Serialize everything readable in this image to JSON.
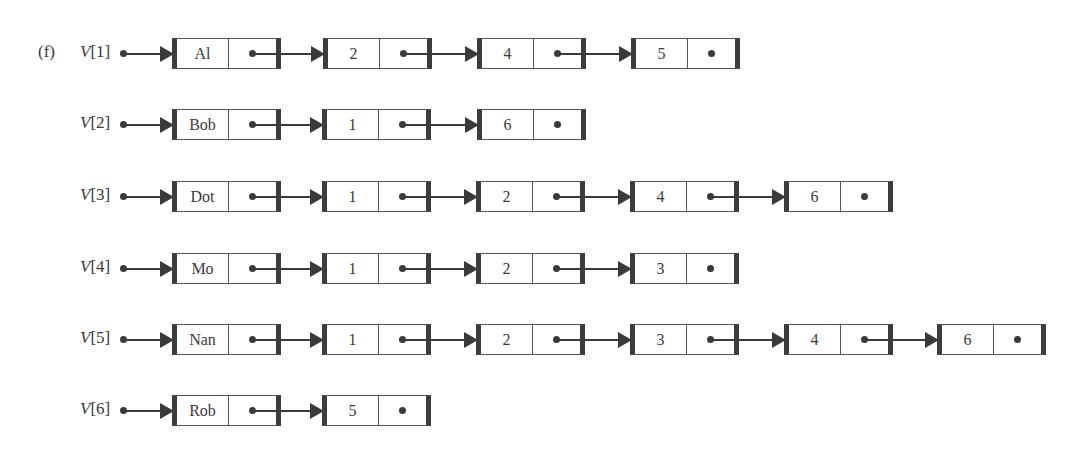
{
  "figure_label": "(f)",
  "lists": [
    {
      "head": "V[1]",
      "nodes": [
        "Al",
        "2",
        "4",
        "5"
      ]
    },
    {
      "head": "V[2]",
      "nodes": [
        "Bob",
        "1",
        "6"
      ]
    },
    {
      "head": "V[3]",
      "nodes": [
        "Dot",
        "1",
        "2",
        "4",
        "6"
      ]
    },
    {
      "head": "V[4]",
      "nodes": [
        "Mo",
        "1",
        "2",
        "3"
      ]
    },
    {
      "head": "V[5]",
      "nodes": [
        "Nan",
        "1",
        "2",
        "3",
        "4",
        "6"
      ]
    },
    {
      "head": "V[6]",
      "nodes": [
        "Rob",
        "5"
      ]
    }
  ],
  "colors": {
    "ink": "#3a3a3a",
    "border": "#3c3c3c",
    "background": "#ffffff"
  }
}
